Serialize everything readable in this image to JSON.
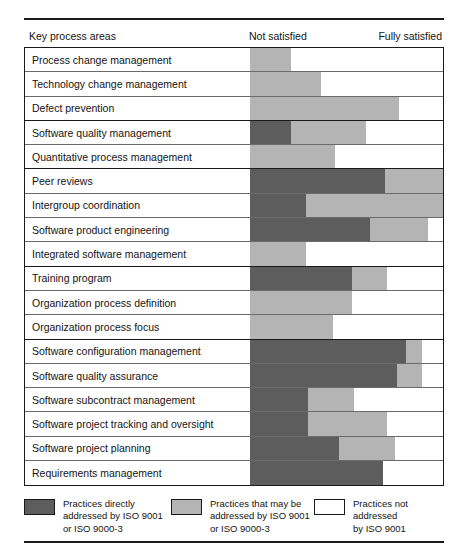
{
  "figure": {
    "header": {
      "row_label_column": "Key process areas",
      "scale_left": "Not satisfied",
      "scale_right": "Fully satisfied"
    },
    "legend": [
      {
        "swatch": "dark",
        "color": "#5d5d5d",
        "text": "Practices directly\naddressed by ISO 9001\nor ISO 9000-3"
      },
      {
        "swatch": "mid",
        "color": "#b4b4b4",
        "text": "Practices that may be\naddressed by ISO 9001\nor ISO 9000-3"
      },
      {
        "swatch": "light",
        "color": "#ffffff",
        "text": "Practices not addressed\nby ISO 9001"
      }
    ]
  },
  "chart_data": {
    "type": "bar",
    "orientation": "horizontal",
    "stacked": true,
    "title": "",
    "xlabel": "",
    "ylabel": "Key process areas",
    "xlim": [
      0,
      100
    ],
    "grid": false,
    "legend_position": "bottom",
    "axis_annotations": {
      "left": "Not satisfied",
      "right": "Fully satisfied"
    },
    "series": [
      {
        "name": "Practices directly addressed by ISO 9001 or ISO 9000-3",
        "color": "#5d5d5d"
      },
      {
        "name": "Practices that may be addressed by ISO 9001 or ISO 9000-3",
        "color": "#b4b4b4"
      },
      {
        "name": "Practices not addressed by ISO 9001",
        "color": "#ffffff"
      }
    ],
    "categories": [
      "Process change management",
      "Technology change management",
      "Defect prevention",
      "Software quality management",
      "Quantitative process management",
      "Peer reviews",
      "Intergroup coordination",
      "Software product engineering",
      "Integrated software management",
      "Training program",
      "Organization process definition",
      "Organization process focus",
      "Software configuration management",
      "Software quality assurance",
      "Software subcontract management",
      "Software project tracking and oversight",
      "Software project planning",
      "Requirements management"
    ],
    "rows": [
      {
        "label": "Process change management",
        "dark": 0,
        "mid": 21,
        "light": 79,
        "group_end": false
      },
      {
        "label": "Technology change management",
        "dark": 0,
        "mid": 37,
        "light": 63,
        "group_end": false
      },
      {
        "label": "Defect prevention",
        "dark": 0,
        "mid": 77,
        "light": 23,
        "group_end": true
      },
      {
        "label": "Software quality management",
        "dark": 21,
        "mid": 39,
        "light": 40,
        "group_end": false
      },
      {
        "label": "Quantitative process management",
        "dark": 0,
        "mid": 44,
        "light": 56,
        "group_end": true
      },
      {
        "label": "Peer reviews",
        "dark": 70,
        "mid": 30,
        "light": 0,
        "group_end": false
      },
      {
        "label": "Intergroup coordination",
        "dark": 29,
        "mid": 71,
        "light": 0,
        "group_end": false
      },
      {
        "label": "Software product engineering",
        "dark": 62,
        "mid": 30,
        "light": 8,
        "group_end": false
      },
      {
        "label": "Integrated software management",
        "dark": 0,
        "mid": 29,
        "light": 71,
        "group_end": true
      },
      {
        "label": "Training program",
        "dark": 53,
        "mid": 18,
        "light": 29,
        "group_end": false
      },
      {
        "label": "Organization process definition",
        "dark": 0,
        "mid": 53,
        "light": 47,
        "group_end": false
      },
      {
        "label": "Organization process focus",
        "dark": 0,
        "mid": 43,
        "light": 57,
        "group_end": true
      },
      {
        "label": "Software configuration management",
        "dark": 81,
        "mid": 8,
        "light": 11,
        "group_end": false
      },
      {
        "label": "Software quality assurance",
        "dark": 76,
        "mid": 13,
        "light": 11,
        "group_end": false
      },
      {
        "label": "Software subcontract management",
        "dark": 30,
        "mid": 24,
        "light": 46,
        "group_end": false
      },
      {
        "label": "Software project tracking and oversight",
        "dark": 30,
        "mid": 41,
        "light": 29,
        "group_end": false
      },
      {
        "label": "Software project planning",
        "dark": 46,
        "mid": 29,
        "light": 25,
        "group_end": false
      },
      {
        "label": "Requirements management",
        "dark": 69,
        "mid": 0,
        "light": 31,
        "group_end": false
      }
    ]
  }
}
